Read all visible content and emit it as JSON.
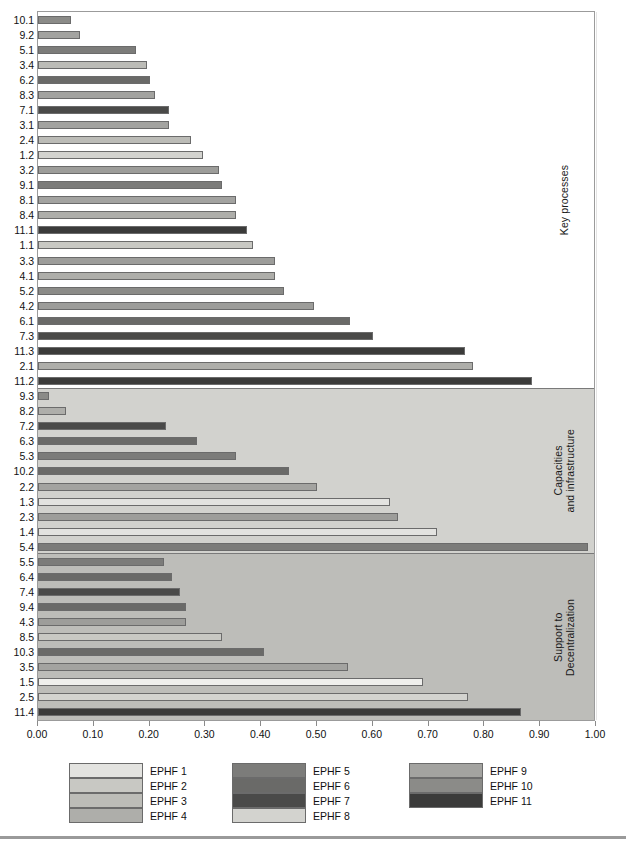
{
  "figure": {
    "title_sliver": "",
    "bottom_rule": true
  },
  "axis": {
    "x_ticks": [
      "0.00",
      "0.10",
      "0.20",
      "0.30",
      "0.40",
      "0.50",
      "0.60",
      "0.70",
      "0.80",
      "0.90",
      "1.00"
    ],
    "x_tick_values": [
      0.0,
      0.1,
      0.2,
      0.3,
      0.4,
      0.5,
      0.6,
      0.7,
      0.8,
      0.9,
      1.0
    ],
    "xlim": [
      0.0,
      1.0
    ]
  },
  "legend": {
    "columns": [
      [
        {
          "label": "EPHF 1",
          "color": "#e3e3e0"
        },
        {
          "label": "EPHF 2",
          "color": "#c8c8c3"
        },
        {
          "label": "EPHF 3",
          "color": "#bcbcb7"
        },
        {
          "label": "EPHF 4",
          "color": "#aeaeaa"
        }
      ],
      [
        {
          "label": "EPHF 5",
          "color": "#7c7c7a"
        },
        {
          "label": "EPHF 6",
          "color": "#6a6a68"
        },
        {
          "label": "EPHF 7",
          "color": "#4a4a49"
        },
        {
          "label": "EPHF 8",
          "color": "#d3d3cf"
        }
      ],
      [
        {
          "label": "EPHF 9",
          "color": "#a3a3a0"
        },
        {
          "label": "EPHF 10",
          "color": "#8b8b88"
        },
        {
          "label": "EPHF 11",
          "color": "#3b3b3a"
        }
      ]
    ]
  },
  "chart_data": {
    "type": "bar",
    "orientation": "horizontal",
    "title": "",
    "xlabel": "",
    "ylabel": "",
    "xlim": [
      0.0,
      1.0
    ],
    "grid": true,
    "legend_position": "bottom",
    "series_palette": {
      "EPHF 1": "#e3e3e0",
      "EPHF 2": "#c8c8c3",
      "EPHF 3": "#bcbcb7",
      "EPHF 4": "#aeaeaa",
      "EPHF 5": "#7c7c7a",
      "EPHF 6": "#6a6a68",
      "EPHF 7": "#4a4a49",
      "EPHF 8": "#d3d3cf",
      "EPHF 9": "#a3a3a0",
      "EPHF 10": "#8b8b88",
      "EPHF 11": "#3b3b3a"
    },
    "groups": [
      {
        "label": "Key processes",
        "background": "#ffffff",
        "bars": [
          {
            "category": "10.1",
            "value": 0.06,
            "ephf": "EPHF 10",
            "color": "#8b8b88"
          },
          {
            "category": "9.2",
            "value": 0.075,
            "ephf": "EPHF 9",
            "color": "#a3a3a0"
          },
          {
            "category": "5.1",
            "value": 0.175,
            "ephf": "EPHF 5",
            "color": "#7c7c7a"
          },
          {
            "category": "3.4",
            "value": 0.195,
            "ephf": "EPHF 3",
            "color": "#bcbcb7"
          },
          {
            "category": "6.2",
            "value": 0.2,
            "ephf": "EPHF 6",
            "color": "#6a6a68"
          },
          {
            "category": "8.3",
            "value": 0.21,
            "ephf": "EPHF 8",
            "color": "#a3a3a0"
          },
          {
            "category": "7.1",
            "value": 0.235,
            "ephf": "EPHF 7",
            "color": "#4a4a49"
          },
          {
            "category": "3.1",
            "value": 0.235,
            "ephf": "EPHF 3",
            "color": "#a3a3a0"
          },
          {
            "category": "2.4",
            "value": 0.275,
            "ephf": "EPHF 2",
            "color": "#bcbcb7"
          },
          {
            "category": "1.2",
            "value": 0.295,
            "ephf": "EPHF 1",
            "color": "#d3d3cf"
          },
          {
            "category": "3.2",
            "value": 0.325,
            "ephf": "EPHF 3",
            "color": "#9d9d9a"
          },
          {
            "category": "9.1",
            "value": 0.33,
            "ephf": "EPHF 9",
            "color": "#7c7c7a"
          },
          {
            "category": "8.1",
            "value": 0.355,
            "ephf": "EPHF 8",
            "color": "#a3a3a0"
          },
          {
            "category": "8.4",
            "value": 0.355,
            "ephf": "EPHF 8",
            "color": "#aeaeaa"
          },
          {
            "category": "11.1",
            "value": 0.375,
            "ephf": "EPHF 11",
            "color": "#3b3b3a"
          },
          {
            "category": "1.1",
            "value": 0.385,
            "ephf": "EPHF 1",
            "color": "#c8c8c3"
          },
          {
            "category": "3.3",
            "value": 0.425,
            "ephf": "EPHF 3",
            "color": "#9d9d9a"
          },
          {
            "category": "4.1",
            "value": 0.425,
            "ephf": "EPHF 4",
            "color": "#aeaeaa"
          },
          {
            "category": "5.2",
            "value": 0.44,
            "ephf": "EPHF 5",
            "color": "#8b8b88"
          },
          {
            "category": "4.2",
            "value": 0.495,
            "ephf": "EPHF 4",
            "color": "#9d9d9a"
          },
          {
            "category": "6.1",
            "value": 0.56,
            "ephf": "EPHF 6",
            "color": "#6a6a68"
          },
          {
            "category": "7.3",
            "value": 0.6,
            "ephf": "EPHF 7",
            "color": "#4a4a49"
          },
          {
            "category": "11.3",
            "value": 0.765,
            "ephf": "EPHF 11",
            "color": "#3b3b3a"
          },
          {
            "category": "2.1",
            "value": 0.78,
            "ephf": "EPHF 2",
            "color": "#aeaeaa"
          },
          {
            "category": "11.2",
            "value": 0.885,
            "ephf": "EPHF 11",
            "color": "#3b3b3a"
          }
        ]
      },
      {
        "label": "Capacities\nand infrastructure",
        "background": "#d2d2ce",
        "bars": [
          {
            "category": "9.3",
            "value": 0.02,
            "ephf": "EPHF 9",
            "color": "#8b8b88"
          },
          {
            "category": "8.2",
            "value": 0.05,
            "ephf": "EPHF 8",
            "color": "#aeaeaa"
          },
          {
            "category": "7.2",
            "value": 0.23,
            "ephf": "EPHF 7",
            "color": "#4a4a49"
          },
          {
            "category": "6.3",
            "value": 0.285,
            "ephf": "EPHF 6",
            "color": "#6a6a68"
          },
          {
            "category": "5.3",
            "value": 0.355,
            "ephf": "EPHF 5",
            "color": "#7c7c7a"
          },
          {
            "category": "10.2",
            "value": 0.45,
            "ephf": "EPHF 10",
            "color": "#6a6a68"
          },
          {
            "category": "2.2",
            "value": 0.5,
            "ephf": "EPHF 2",
            "color": "#a3a3a0"
          },
          {
            "category": "1.3",
            "value": 0.63,
            "ephf": "EPHF 1",
            "color": "#e3e3e0"
          },
          {
            "category": "2.3",
            "value": 0.645,
            "ephf": "EPHF 2",
            "color": "#9d9d9a"
          },
          {
            "category": "1.4",
            "value": 0.715,
            "ephf": "EPHF 1",
            "color": "#e3e3e0"
          },
          {
            "category": "5.4",
            "value": 0.985,
            "ephf": "EPHF 5",
            "color": "#7c7c7a"
          }
        ]
      },
      {
        "label": "Support to\nDecentralization",
        "background": "#bdbdb9",
        "bars": [
          {
            "category": "5.5",
            "value": 0.225,
            "ephf": "EPHF 5",
            "color": "#7c7c7a"
          },
          {
            "category": "6.4",
            "value": 0.24,
            "ephf": "EPHF 6",
            "color": "#6a6a68"
          },
          {
            "category": "7.4",
            "value": 0.255,
            "ephf": "EPHF 7",
            "color": "#4a4a49"
          },
          {
            "category": "9.4",
            "value": 0.265,
            "ephf": "EPHF 9",
            "color": "#6a6a68"
          },
          {
            "category": "4.3",
            "value": 0.265,
            "ephf": "EPHF 4",
            "color": "#9d9d9a"
          },
          {
            "category": "8.5",
            "value": 0.33,
            "ephf": "EPHF 8",
            "color": "#c8c8c3"
          },
          {
            "category": "10.3",
            "value": 0.405,
            "ephf": "EPHF 10",
            "color": "#6a6a68"
          },
          {
            "category": "3.5",
            "value": 0.555,
            "ephf": "EPHF 3",
            "color": "#a3a3a0"
          },
          {
            "category": "1.5",
            "value": 0.69,
            "ephf": "EPHF 1",
            "color": "#efefec"
          },
          {
            "category": "2.5",
            "value": 0.77,
            "ephf": "EPHF 2",
            "color": "#d3d3cf"
          },
          {
            "category": "11.4",
            "value": 0.865,
            "ephf": "EPHF 11",
            "color": "#3b3b3a"
          }
        ]
      }
    ]
  }
}
